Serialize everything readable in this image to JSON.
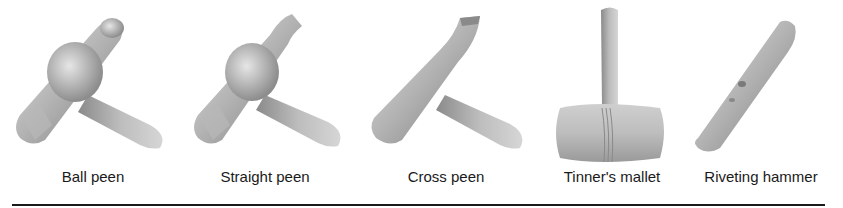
{
  "figure": {
    "items": [
      {
        "id": "ball-peen",
        "label": "Ball peen",
        "label_x": 93
      },
      {
        "id": "straight-peen",
        "label": "Straight peen",
        "label_x": 265
      },
      {
        "id": "cross-peen",
        "label": "Cross peen",
        "label_x": 446
      },
      {
        "id": "tinners-mallet",
        "label": "Tinner's mallet",
        "label_x": 612
      },
      {
        "id": "riveting-hammer",
        "label": "Riveting hammer",
        "label_x": 761
      }
    ],
    "colors": {
      "metal_light": "#d8d8d8",
      "metal_mid": "#a9a9a9",
      "metal_dark": "#6f6f6f",
      "text": "#1a1a1a",
      "rule": "#1a1a1a"
    }
  }
}
